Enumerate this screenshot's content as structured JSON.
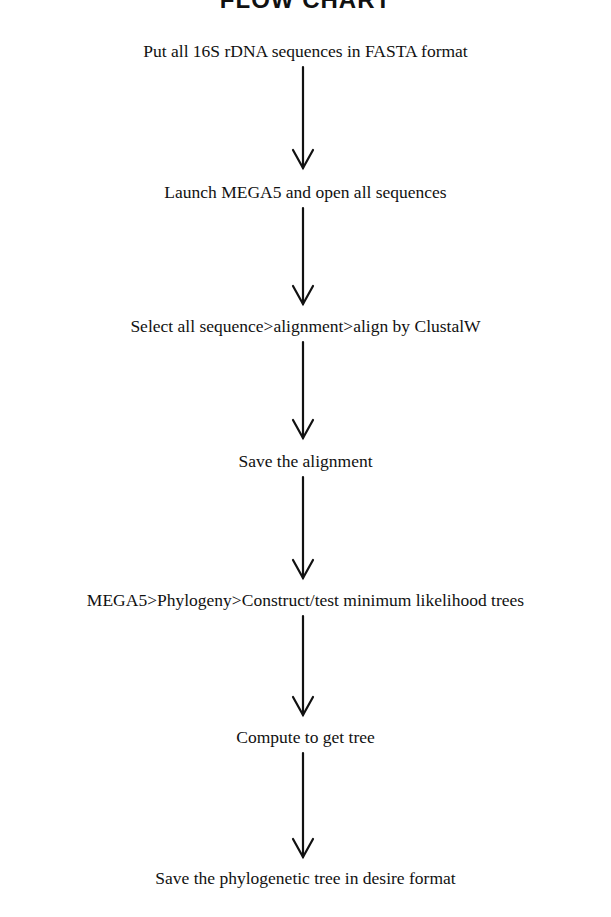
{
  "title": "FLOW CHART",
  "steps": [
    {
      "label": "Put all 16S rDNA sequences in FASTA format"
    },
    {
      "label": "Launch MEGA5 and open all sequences"
    },
    {
      "label": "Select all sequence>alignment>align by ClustalW"
    },
    {
      "label": "Save the alignment"
    },
    {
      "label": "MEGA5>Phylogeny>Construct/test minimum likelihood trees"
    },
    {
      "label": "Compute to get tree"
    },
    {
      "label": "Save the phylogenetic tree in desire format"
    }
  ],
  "connectors": [
    {
      "from": 0,
      "to": 1
    },
    {
      "from": 1,
      "to": 2
    },
    {
      "from": 2,
      "to": 3
    },
    {
      "from": 3,
      "to": 4
    },
    {
      "from": 4,
      "to": 5
    },
    {
      "from": 5,
      "to": 6
    }
  ]
}
